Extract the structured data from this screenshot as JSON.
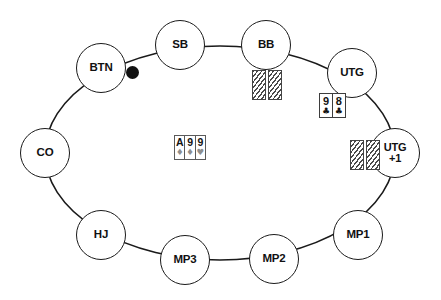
{
  "diagram": {
    "type": "poker-table-positions",
    "background_color": "#ffffff",
    "line_color": "#1a1a1a",
    "table_shape": "ellipse"
  },
  "seats": [
    {
      "id": "sb",
      "label": "SB",
      "name": "Small Blind",
      "x": 180,
      "y": 45,
      "r": 25
    },
    {
      "id": "bb",
      "label": "BB",
      "name": "Big Blind",
      "x": 266,
      "y": 45,
      "r": 25
    },
    {
      "id": "utg",
      "label": "UTG",
      "name": "Under The Gun",
      "x": 352,
      "y": 73,
      "r": 25
    },
    {
      "id": "utg1",
      "label": "UTG\n+1",
      "name": "Under The Gun +1",
      "x": 395,
      "y": 153,
      "r": 25
    },
    {
      "id": "mp1",
      "label": "MP1",
      "name": "Middle Position 1",
      "x": 358,
      "y": 235,
      "r": 25
    },
    {
      "id": "mp2",
      "label": "MP2",
      "name": "Middle Position 2",
      "x": 274,
      "y": 259,
      "r": 25
    },
    {
      "id": "mp3",
      "label": "MP3",
      "name": "Middle Position 3",
      "x": 185,
      "y": 260,
      "r": 25
    },
    {
      "id": "hj",
      "label": "HJ",
      "name": "Hijack",
      "x": 101,
      "y": 235,
      "r": 25
    },
    {
      "id": "co",
      "label": "CO",
      "name": "Cutoff",
      "x": 45,
      "y": 153,
      "r": 25
    },
    {
      "id": "btn",
      "label": "BTN",
      "name": "Button",
      "x": 101,
      "y": 68,
      "r": 25
    }
  ],
  "dealer_button": {
    "name": "dealer-button-marker",
    "shape": "filled-circle",
    "color": "#111111",
    "x": 132,
    "y": 72,
    "size": 13
  },
  "board": {
    "name": "community-cards",
    "x": 174,
    "y": 135,
    "cards": [
      {
        "rank": "A",
        "suit": "♦",
        "suit_name": "diamonds",
        "muted": true
      },
      {
        "rank": "9",
        "suit": "♦",
        "suit_name": "diamonds",
        "muted": true
      },
      {
        "rank": "9",
        "suit": "♥",
        "suit_name": "hearts",
        "muted": true
      }
    ]
  },
  "hole_cards": [
    {
      "seat": "utg",
      "name": "utg-hole-cards",
      "face": "up",
      "x": 319,
      "y": 93,
      "cards": [
        {
          "rank": "9",
          "suit": "♣",
          "suit_name": "clubs"
        },
        {
          "rank": "8",
          "suit": "♣",
          "suit_name": "clubs"
        }
      ]
    }
  ],
  "folded_hands": [
    {
      "seat": "bb",
      "name": "bb-folded-cards",
      "x": 252,
      "y": 70,
      "count": 2,
      "gap": true
    },
    {
      "seat": "utg1",
      "name": "utg1-folded-cards",
      "x": 350,
      "y": 140,
      "count": 2,
      "gap": true
    }
  ]
}
